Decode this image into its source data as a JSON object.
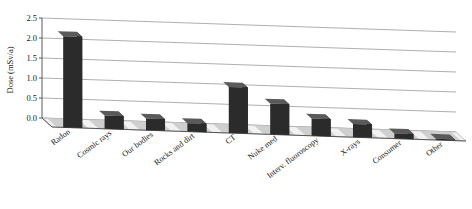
{
  "chart_data": {
    "type": "bar",
    "title": "",
    "subtitle": "",
    "xlabel": "",
    "ylabel": "Dose (mSv/a)",
    "ylim": [
      0.0,
      2.5
    ],
    "ytick_labels": [
      "0.0",
      "0.5",
      "1.0",
      "1.5",
      "2.0",
      "2.5"
    ],
    "ytick_values": [
      0.0,
      0.5,
      1.0,
      1.5,
      2.0,
      2.5
    ],
    "grid": true,
    "legend": "none",
    "three_d": true,
    "categories": [
      "Radon",
      "Cosmic rays",
      "Our bodies",
      "Rocks and dirt",
      "CT",
      "Nuke med",
      "Interv. fluoroscopy",
      "X-rays",
      "Consumer",
      "Other"
    ],
    "values": [
      2.28,
      0.33,
      0.29,
      0.21,
      1.15,
      0.77,
      0.43,
      0.33,
      0.13,
      0.03
    ],
    "bar_color": "#2b2b2b",
    "bar_side_color": "#151515",
    "bar_top_color": "#5a5a5a",
    "grid_color": "#8d8d8d",
    "axis_color": "#4a4a4a",
    "background_color": "#ffffff",
    "floor_color": "#f2f2f2"
  }
}
